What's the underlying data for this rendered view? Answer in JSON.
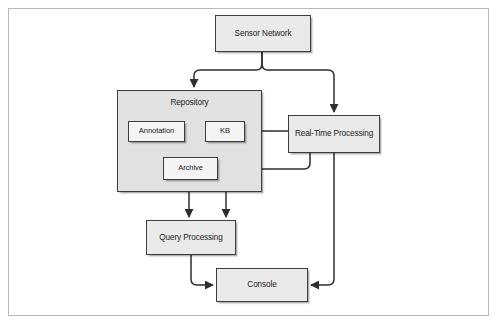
{
  "diagram": {
    "colors": {
      "frame_border": "#b9b9b9",
      "node_border": "#3d3d3d",
      "node_fill": "#eaeaea",
      "inner_node_fill": "#f4f4f4",
      "group_fill": "#e1e1e1",
      "connector": "#2e2e2e",
      "background": "#ffffff"
    },
    "nodes": [
      {
        "id": "sensor-network",
        "label": "Sensor Network",
        "x": 215,
        "y": 15,
        "w": 96,
        "h": 37,
        "kind": "outer"
      },
      {
        "id": "repository",
        "label": "Repository",
        "x": 117,
        "y": 90,
        "w": 145,
        "h": 102,
        "kind": "group"
      },
      {
        "id": "annotation",
        "label": "Annotation",
        "x": 128,
        "y": 121,
        "w": 57,
        "h": 21,
        "kind": "inner"
      },
      {
        "id": "kb",
        "label": "KB",
        "x": 205,
        "y": 121,
        "w": 40,
        "h": 21,
        "kind": "inner"
      },
      {
        "id": "archive",
        "label": "Archive",
        "x": 163,
        "y": 157,
        "w": 55,
        "h": 23,
        "kind": "inner"
      },
      {
        "id": "real-time-processing",
        "label": "Real-Time Processing",
        "x": 288,
        "y": 115,
        "w": 92,
        "h": 38,
        "kind": "outer"
      },
      {
        "id": "query-processing",
        "label": "Query Processing",
        "x": 146,
        "y": 220,
        "w": 90,
        "h": 35,
        "kind": "outer"
      },
      {
        "id": "console",
        "label": "Console",
        "x": 216,
        "y": 268,
        "w": 92,
        "h": 34,
        "kind": "outer"
      }
    ],
    "edges": [
      {
        "id": "sensor-to-repository",
        "from": "sensor-network",
        "to": "repository"
      },
      {
        "id": "sensor-to-realtime",
        "from": "sensor-network",
        "to": "real-time-processing"
      },
      {
        "id": "realtime-to-kb",
        "from": "real-time-processing",
        "to": "kb"
      },
      {
        "id": "realtime-to-archive",
        "from": "real-time-processing",
        "to": "archive"
      },
      {
        "id": "archive-to-query",
        "from": "archive",
        "to": "query-processing"
      },
      {
        "id": "kb-to-query",
        "from": "kb",
        "to": "query-processing"
      },
      {
        "id": "query-to-console",
        "from": "query-processing",
        "to": "console"
      },
      {
        "id": "realtime-to-console",
        "from": "real-time-processing",
        "to": "console"
      }
    ]
  }
}
